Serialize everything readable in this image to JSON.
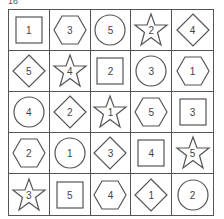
{
  "label": "16",
  "grid": {
    "rows": 5,
    "cols": 5,
    "cells": [
      [
        {
          "shape": "square",
          "n": "1"
        },
        {
          "shape": "hexagon",
          "n": "3"
        },
        {
          "shape": "circle",
          "n": "5"
        },
        {
          "shape": "star",
          "n": "2"
        },
        {
          "shape": "diamond",
          "n": "4"
        }
      ],
      [
        {
          "shape": "diamond",
          "n": "5"
        },
        {
          "shape": "star",
          "n": "4"
        },
        {
          "shape": "square",
          "n": "2"
        },
        {
          "shape": "circle",
          "n": "3"
        },
        {
          "shape": "hexagon",
          "n": "1"
        }
      ],
      [
        {
          "shape": "circle",
          "n": "4"
        },
        {
          "shape": "diamond",
          "n": "2"
        },
        {
          "shape": "star",
          "n": "1"
        },
        {
          "shape": "hexagon",
          "n": "5"
        },
        {
          "shape": "square",
          "n": "3"
        }
      ],
      [
        {
          "shape": "hexagon",
          "n": "2"
        },
        {
          "shape": "circle",
          "n": "1"
        },
        {
          "shape": "diamond",
          "n": "3"
        },
        {
          "shape": "square",
          "n": "4"
        },
        {
          "shape": "star",
          "n": "5"
        }
      ],
      [
        {
          "shape": "star",
          "n": "3"
        },
        {
          "shape": "square",
          "n": "5"
        },
        {
          "shape": "hexagon",
          "n": "4"
        },
        {
          "shape": "diamond",
          "n": "1"
        },
        {
          "shape": "circle",
          "n": "2"
        }
      ]
    ]
  },
  "colors": {
    "stroke": "#555555",
    "text": "#444444"
  }
}
